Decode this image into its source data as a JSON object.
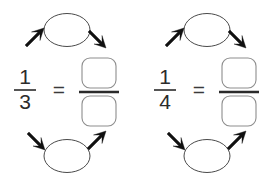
{
  "page": {
    "background_color": "#ffffff",
    "width": 278,
    "height": 185
  },
  "groups": [
    {
      "id": "left-group",
      "fraction": {
        "numerator": "1",
        "denominator": "3",
        "label": "1/3"
      },
      "equals_sign": "=",
      "result": {
        "numerator_box": "",
        "denominator_box": "",
        "numerator_placeholder": "empty-box",
        "denominator_placeholder": "empty-box"
      },
      "bubbles": [
        {
          "position": "top",
          "content": ""
        },
        {
          "position": "bottom",
          "content": ""
        }
      ],
      "arrows": [
        {
          "id": "top-left-arrow",
          "direction": "up-right",
          "glyph": "↗"
        },
        {
          "id": "top-right-arrow",
          "direction": "down-right",
          "glyph": "↘"
        },
        {
          "id": "bottom-left-arrow",
          "direction": "down-right",
          "glyph": "↘"
        },
        {
          "id": "bottom-right-arrow",
          "direction": "up-right",
          "glyph": "↗"
        }
      ]
    },
    {
      "id": "right-group",
      "fraction": {
        "numerator": "1",
        "denominator": "4",
        "label": "1/4"
      },
      "equals_sign": "=",
      "result": {
        "numerator_box": "",
        "denominator_box": "",
        "numerator_placeholder": "empty-box",
        "denominator_placeholder": "empty-box"
      },
      "bubbles": [
        {
          "position": "top",
          "content": ""
        },
        {
          "position": "bottom",
          "content": ""
        }
      ],
      "arrows": [
        {
          "id": "top-left-arrow",
          "direction": "up-right",
          "glyph": "↗"
        },
        {
          "id": "top-right-arrow",
          "direction": "down-right",
          "glyph": "↘"
        },
        {
          "id": "bottom-left-arrow",
          "direction": "down-right",
          "glyph": "↘"
        },
        {
          "id": "bottom-right-arrow",
          "direction": "up-right",
          "glyph": "↗"
        }
      ]
    }
  ],
  "colors": {
    "ink": "#2b2b2b",
    "arrow": "#111111",
    "ellipse_stroke": "#4a4a4a",
    "box_stroke": "#8d8d8d",
    "background": "#ffffff"
  }
}
